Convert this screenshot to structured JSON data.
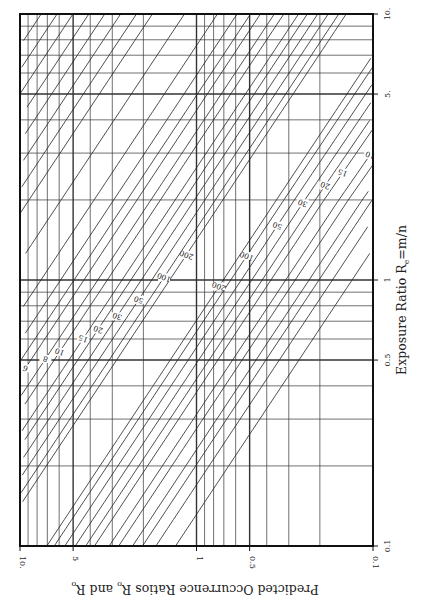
{
  "chart_data": {
    "type": "line",
    "orientation": "rotated 90 degrees clockwise (printed sideways)",
    "title": "",
    "xlabel": "Exposure Ratio R_e=m/n",
    "ylabel": "Predicted Occurrence Ratios R̂o and R̃o",
    "x_axis": {
      "label": "Exposure Ratio R",
      "label_sub": "e",
      "label_suffix": "=m/n",
      "scale": "log",
      "range": [
        0.1,
        10
      ],
      "ticks": [
        {
          "value": 0.1,
          "label": "0.1"
        },
        {
          "value": 0.5,
          "label": "0.5"
        },
        {
          "value": 1,
          "label": "1"
        },
        {
          "value": 5,
          "label": "5."
        },
        {
          "value": 10,
          "label": "10."
        }
      ]
    },
    "y_axis": {
      "label": "Predicted Occurrence Ratios R̂o and R̃o",
      "label_main": "Predicted Occurrence Ratios ",
      "scale": "log",
      "range": [
        0.1,
        10
      ],
      "ticks": [
        {
          "value": 10,
          "label": "10."
        },
        {
          "value": 5,
          "label": "5"
        },
        {
          "value": 1,
          "label": "1"
        },
        {
          "value": 0.5,
          "label": "0.5"
        },
        {
          "value": 0.1,
          "label": "0.1"
        }
      ]
    },
    "grid": true,
    "legend": "none (curves labeled inline)",
    "curve_parameter_labels": [
      "2",
      "3",
      "4",
      "5",
      "6",
      "8",
      "10",
      "15",
      "20",
      "30",
      "50",
      "100",
      "200"
    ],
    "series": [
      {
        "name": "upper bound curves (labels near low exposure ratio)",
        "labels": [
          "2",
          "3",
          "4",
          "5",
          "6",
          "8",
          "10",
          "15",
          "20",
          "30",
          "50",
          "100",
          "200"
        ]
      },
      {
        "name": "lower bound curves (labels near high exposure ratio)",
        "labels": [
          "3",
          "4",
          "5",
          "6",
          "8",
          "10",
          "15",
          "20",
          "30",
          "50",
          "100",
          "200"
        ]
      }
    ]
  }
}
